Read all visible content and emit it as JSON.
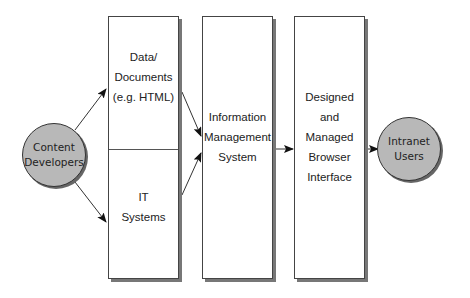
{
  "diagram": {
    "nodes": {
      "content_developers": {
        "label_line1": "Content",
        "label_line2": "Developers",
        "shape": "circle"
      },
      "data_documents": {
        "line1": "Data/",
        "line2": "Documents",
        "line3": "(e.g. HTML)",
        "shape": "box-upper"
      },
      "it_systems": {
        "line1": "IT",
        "line2": "Systems",
        "shape": "box-lower"
      },
      "ims": {
        "line1": "Information",
        "line2": "Management",
        "line3": "System",
        "shape": "box"
      },
      "browser_interface": {
        "line1": "Designed",
        "line2": "and",
        "line3": "Managed",
        "line4": "Browser",
        "line5": "Interface",
        "shape": "box"
      },
      "intranet_users": {
        "label_line1": "Intranet",
        "label_line2": "Users",
        "shape": "circle"
      }
    },
    "edges": [
      {
        "from": "Content Developers",
        "to": "Data/Documents (e.g. HTML)"
      },
      {
        "from": "Content Developers",
        "to": "IT Systems"
      },
      {
        "from": "Data/Documents (e.g. HTML)",
        "to": "Information Management System"
      },
      {
        "from": "IT Systems",
        "to": "Information Management System"
      },
      {
        "from": "Information Management System",
        "to": "Designed and Managed Browser Interface"
      },
      {
        "from": "Designed and Managed Browser Interface",
        "to": "Intranet Users"
      }
    ],
    "colors": {
      "circle_fill": "#b8b8b8",
      "stroke": "#333333",
      "shadow": "#777777"
    }
  }
}
